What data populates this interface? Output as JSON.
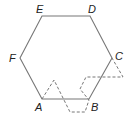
{
  "diagram": {
    "type": "hexagon-with-dashed-path",
    "vertices": [
      {
        "label": "A",
        "x": 42,
        "y": 99,
        "lx": 35,
        "ly": 111
      },
      {
        "label": "B",
        "x": 89,
        "y": 99,
        "lx": 91,
        "ly": 111
      },
      {
        "label": "C",
        "x": 112,
        "y": 58,
        "lx": 115,
        "ly": 60
      },
      {
        "label": "D",
        "x": 90,
        "y": 16,
        "lx": 88,
        "ly": 13
      },
      {
        "label": "E",
        "x": 42,
        "y": 16,
        "lx": 36,
        "ly": 13
      },
      {
        "label": "F",
        "x": 20,
        "y": 58,
        "lx": 9,
        "ly": 62
      }
    ],
    "hexagon_points": "42,99 89,99 112,58 90,16 42,16 20,58",
    "dashed_path": "42,99 54,80 70,112 85,112 89,100 80,89 86,77 123,77 112,58",
    "colors": {
      "solid": "#777777",
      "dashed": "#777777",
      "label": "#222222"
    }
  }
}
